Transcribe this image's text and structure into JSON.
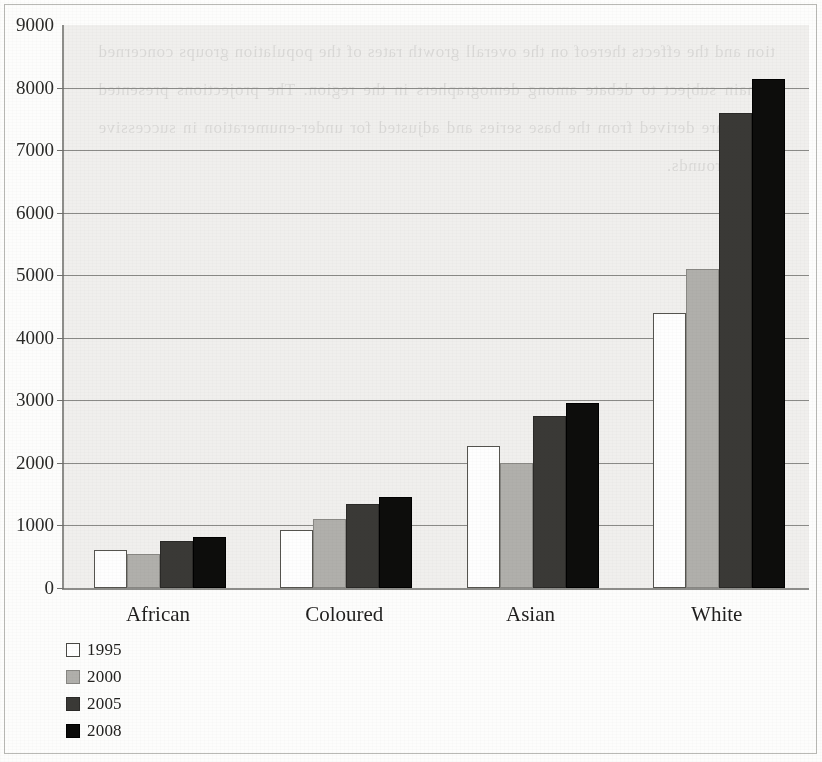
{
  "chart_data": {
    "type": "bar",
    "title": "",
    "subtitle": "",
    "xlabel": "",
    "ylabel": "",
    "categories": [
      "African",
      "Coloured",
      "Asian",
      "White"
    ],
    "series": [
      {
        "name": "1995",
        "color": "#ffffff",
        "values": [
          600,
          920,
          2270,
          4400
        ]
      },
      {
        "name": "2000",
        "color": "#b0afab",
        "values": [
          550,
          1110,
          2000,
          5100
        ]
      },
      {
        "name": "2005",
        "color": "#3a3936",
        "values": [
          750,
          1340,
          2750,
          7600
        ]
      },
      {
        "name": "2008",
        "color": "#0d0d0c",
        "values": [
          820,
          1460,
          2950,
          8130
        ]
      }
    ],
    "ylim": [
      0,
      9000
    ],
    "ytick_step": 1000,
    "ytick_labels": [
      "0",
      "1000",
      "2000",
      "3000",
      "4000",
      "5000",
      "6000",
      "7000",
      "8000",
      "9000"
    ],
    "grid": true,
    "grid_axis": "y",
    "legend_position": "bottom-left",
    "legend_entries": [
      "1995",
      "2000",
      "2005",
      "2008"
    ]
  },
  "figure": {
    "background_color": "#f0efed",
    "axis_color": "#8d8d8a",
    "gridline_color": "#8a8a87",
    "frame_color": "#b9b9b5",
    "bleed_through_text": "tion and the effects thereof on the overall growth rates of the population groups concerned remain subject to debate among demographers in the region. The projections presented below are derived from the base series and adjusted for under-enumeration in successive census rounds."
  }
}
